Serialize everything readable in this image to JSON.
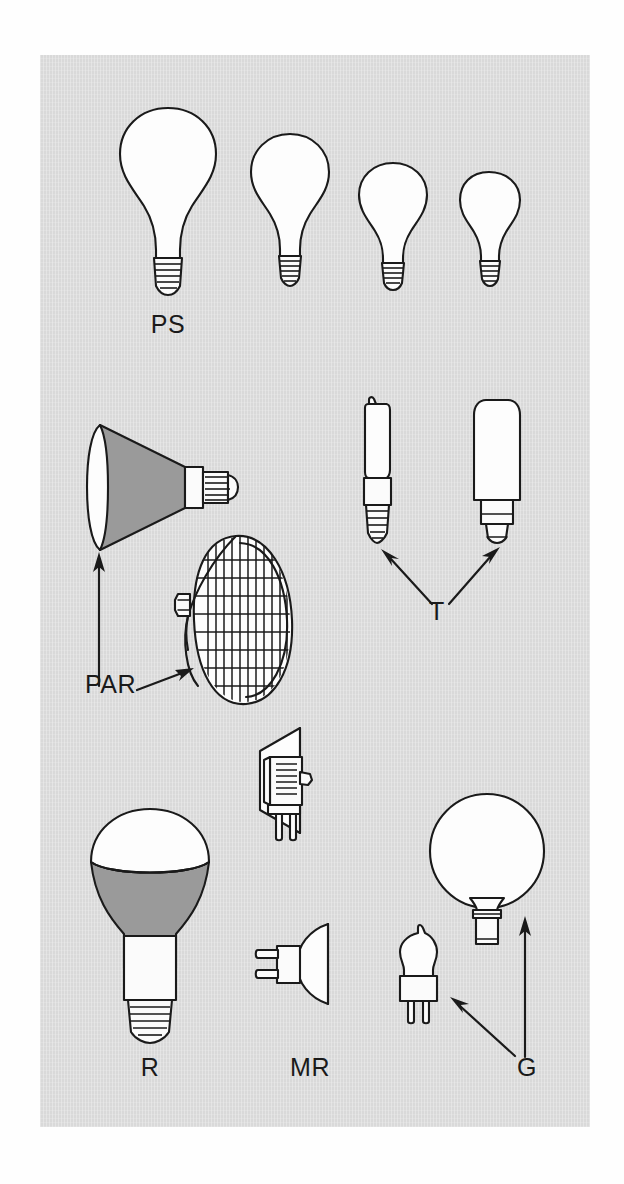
{
  "figure": {
    "kind": "lamp-shape-reference-diagram",
    "background_color": "#d9d9d9",
    "page_color": "#fefefe",
    "ink_color": "#1a1a1a",
    "shade_color": "#9a9a9a",
    "glass_color": "#fdfdfd"
  },
  "labels": {
    "ps": "PS",
    "par": "PAR",
    "t": "T",
    "r": "R",
    "mr": "MR",
    "g": "G"
  },
  "groups": [
    {
      "code": "PS",
      "label": "PS",
      "label_x": 168,
      "label_y": 336,
      "count": 4,
      "description": "Pear-straight neck general service lamps, four decreasing sizes, screw bases"
    },
    {
      "code": "PAR",
      "label": "PAR",
      "label_x": 85,
      "label_y": 696,
      "count": 2,
      "description": "Parabolic aluminized reflector lamps, side view and face view with ribbed lens"
    },
    {
      "code": "T",
      "label": "T",
      "label_x": 437,
      "label_y": 623,
      "count": 2,
      "description": "Tubular lamps, slim screw base and larger tubular bayonet base"
    },
    {
      "code": "R",
      "label": "R",
      "label_x": 150,
      "label_y": 1079,
      "count": 1,
      "description": "Reflector lamp, blown bulged reflector with screw base"
    },
    {
      "code": "MR",
      "label": "MR",
      "label_x": 310,
      "label_y": 1079,
      "count": 2,
      "description": "Multifaceted reflector lamps with two-pin bases"
    },
    {
      "code": "G",
      "label": "G",
      "label_x": 527,
      "label_y": 1079,
      "count": 2,
      "description": "Globe lamp with skirted base and small bi-pin capsule lamp"
    }
  ],
  "arrows": [
    {
      "name": "par-vertical-arrow",
      "from": [
        99,
        686
      ],
      "to": [
        99,
        556
      ]
    },
    {
      "name": "par-diagonal-arrow",
      "from": [
        135,
        688
      ],
      "to": [
        190,
        668
      ]
    },
    {
      "name": "t-left-arrow",
      "from": [
        432,
        608
      ],
      "to": [
        381,
        551
      ]
    },
    {
      "name": "t-right-arrow",
      "from": [
        449,
        608
      ],
      "to": [
        499,
        548
      ]
    },
    {
      "name": "g-vertical-arrow",
      "from": [
        525,
        1057
      ],
      "to": [
        525,
        920
      ]
    },
    {
      "name": "g-diagonal-arrow",
      "from": [
        517,
        1058
      ],
      "to": [
        452,
        1000
      ]
    }
  ]
}
